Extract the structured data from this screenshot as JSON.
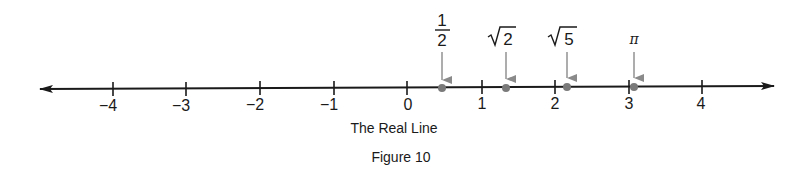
{
  "figure": {
    "axis_label": "The Real Line",
    "caption": "Figure 10",
    "colors": {
      "line": "#1a1a1a",
      "point": "#7a7a7a",
      "arrow": "#8a8a8a"
    }
  },
  "ticks": [
    {
      "value": -4,
      "label": "−4"
    },
    {
      "value": -3,
      "label": "−3"
    },
    {
      "value": -2,
      "label": "−2"
    },
    {
      "value": -1,
      "label": "−1"
    },
    {
      "value": 0,
      "label": "0"
    },
    {
      "value": 1,
      "label": "1"
    },
    {
      "value": 2,
      "label": "2"
    },
    {
      "value": 3,
      "label": "3"
    },
    {
      "value": 4,
      "label": "4"
    }
  ],
  "points": [
    {
      "name": "one-half",
      "value": 0.5,
      "numerator": "1",
      "denominator": "2"
    },
    {
      "name": "sqrt-2",
      "value": 1.414,
      "radicand": "2"
    },
    {
      "name": "sqrt-5",
      "value": 2.236,
      "radicand": "5"
    },
    {
      "name": "pi",
      "value": 3.1416,
      "label": "π"
    }
  ]
}
